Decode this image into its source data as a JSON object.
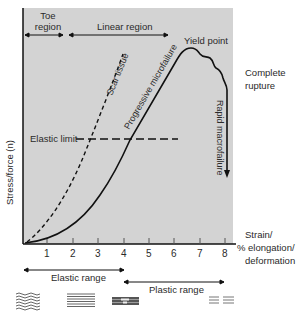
{
  "diagram": {
    "colors": {
      "panel_bg": "#d3d3d3",
      "line": "#111111",
      "text": "#2a2a2a",
      "background": "#ffffff"
    },
    "y_axis_label": "Stress/force (n)",
    "x_axis_label_lines": [
      "Strain/",
      "% elongation/",
      "deformation"
    ],
    "x_ticks": [
      "1",
      "2",
      "3",
      "4",
      "5",
      "6",
      "7",
      "8"
    ],
    "regions": {
      "toe_line1": "Toe",
      "toe_line2": "region",
      "linear": "Linear region"
    },
    "annotations": {
      "yield_point": "Yield point",
      "complete_rupture_line1": "Complete",
      "complete_rupture_line2": "rupture",
      "elastic_limit": "Elastic limit",
      "scar_tissue": "Scar tissue",
      "progressive_microfailure": "Progressive microfailure",
      "rapid_macrofailure": "Rapid macrofailure"
    },
    "ranges": {
      "elastic": "Elastic range",
      "plastic": "Plastic range"
    },
    "fiber_icons": [
      {
        "name": "crimped-fibers-icon",
        "state": "wavy"
      },
      {
        "name": "straight-fibers-icon",
        "state": "aligned"
      },
      {
        "name": "partially-torn-fibers-icon",
        "state": "microfailure"
      },
      {
        "name": "ruptured-fibers-icon",
        "state": "separated"
      }
    ]
  }
}
